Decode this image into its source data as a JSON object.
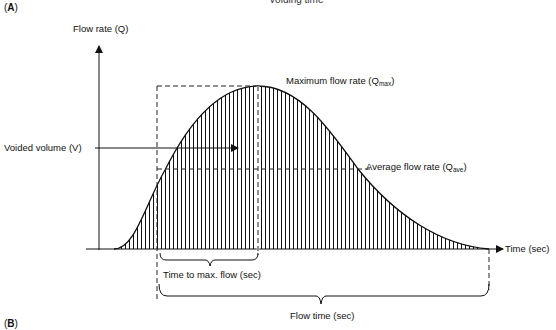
{
  "header": {
    "clipped_title": "Voiding time",
    "panel_a": "A",
    "panel_b": "B"
  },
  "axes": {
    "y_label": "Flow rate (Q)",
    "x_label": "Time (sec)"
  },
  "annotations": {
    "qmax_prefix": "Maximum flow rate (Q",
    "qmax_sub": "max",
    "qmax_suffix": ")",
    "qave_prefix": "Average flow rate (Q",
    "qave_sub": "ave",
    "qave_suffix": ")",
    "voided_volume": "Voided volume (V)",
    "time_to_max": "Time to max. flow (sec)",
    "flow_time": "Flow time (sec)"
  },
  "colors": {
    "line": "#111111",
    "dash": "#222222",
    "background": "#ffffff"
  }
}
